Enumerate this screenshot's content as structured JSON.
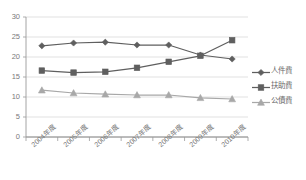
{
  "chart_data": {
    "type": "line",
    "title": "",
    "xlabel": "",
    "ylabel": "",
    "ylim": [
      0,
      30
    ],
    "yticks": [
      0,
      5,
      10,
      15,
      20,
      25,
      30
    ],
    "grid": true,
    "legend_position": "right",
    "categories": [
      "2004年度",
      "2005年度",
      "2006年度",
      "2007年度",
      "2008年度",
      "2009年度",
      "2010年度"
    ],
    "series": [
      {
        "name": "人件費",
        "marker": "diamond",
        "color": "#5f5f5f",
        "values": [
          22.8,
          23.5,
          23.7,
          23.0,
          23.0,
          20.5,
          19.5
        ]
      },
      {
        "name": "扶助費",
        "marker": "square",
        "color": "#5f5f5f",
        "values": [
          16.6,
          16.1,
          16.3,
          17.3,
          18.8,
          20.3,
          24.2
        ]
      },
      {
        "name": "公債費",
        "marker": "triangle",
        "color": "#a8a8a8",
        "values": [
          11.7,
          11.0,
          10.7,
          10.5,
          10.5,
          9.8,
          9.5
        ]
      }
    ]
  },
  "legend": {
    "items": [
      {
        "label": "人件費"
      },
      {
        "label": "扶助費"
      },
      {
        "label": "公債費"
      }
    ]
  },
  "axis": {
    "y_tick_labels": [
      "30",
      "25",
      "20",
      "15",
      "10",
      "5",
      "0"
    ],
    "x_tick_labels": [
      "2004年度",
      "2005年度",
      "2006年度",
      "2007年度",
      "2008年度",
      "2009年度",
      "2010年度"
    ]
  },
  "colors": {
    "grid": "#d9d9d9",
    "axis": "#9a9a9a",
    "series_dark": "#5f5f5f",
    "series_light": "#a8a8a8",
    "text": "#7a7a7a"
  },
  "top_note": ""
}
